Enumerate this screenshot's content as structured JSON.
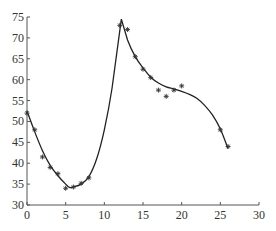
{
  "chart_data": {
    "type": "scatter",
    "title": "",
    "xlabel": "",
    "ylabel": "",
    "xlim": [
      0,
      30
    ],
    "ylim": [
      30,
      75
    ],
    "x_ticks": [
      0,
      5,
      10,
      15,
      20,
      25,
      30
    ],
    "y_ticks": [
      30,
      35,
      40,
      45,
      50,
      55,
      60,
      65,
      70,
      75
    ],
    "x_tick_labels": [
      "0",
      "5",
      "10",
      "15",
      "20",
      "25",
      "30"
    ],
    "y_tick_labels": [
      "30",
      "35",
      "40",
      "45",
      "50",
      "55",
      "60",
      "65",
      "70",
      "75"
    ],
    "grid": false,
    "legend": null,
    "series": [
      {
        "name": "observed",
        "style": "markers",
        "marker": "*",
        "x": [
          0,
          1,
          2,
          3,
          4,
          5,
          6,
          7,
          8,
          12,
          13,
          14,
          15,
          16,
          17,
          18,
          19,
          20,
          25,
          26
        ],
        "y": [
          52,
          48,
          41.5,
          39,
          37.5,
          34,
          34.3,
          35.2,
          36.5,
          73,
          72,
          65.5,
          62.5,
          60.5,
          57.5,
          56,
          57.5,
          58.5,
          48,
          44
        ]
      },
      {
        "name": "fitted",
        "style": "line",
        "x": [
          0,
          1,
          2,
          3,
          4,
          5,
          5.5,
          6,
          7,
          8,
          9,
          10,
          11,
          12.2,
          13,
          14,
          15,
          16,
          17,
          18,
          19,
          20,
          21,
          22,
          23,
          24,
          25,
          26
        ],
        "y": [
          52.5,
          47.5,
          43,
          39.5,
          37,
          35,
          34.2,
          34.3,
          35,
          36.8,
          41,
          48,
          58,
          74.5,
          69.5,
          65.5,
          62.8,
          60.6,
          59.2,
          58.3,
          57.8,
          57.2,
          56.5,
          55.5,
          53.8,
          51.5,
          48.2,
          43.5
        ]
      }
    ]
  }
}
